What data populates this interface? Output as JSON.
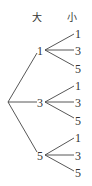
{
  "diagram": {
    "type": "tree",
    "headers": {
      "big": "大",
      "small": "小"
    },
    "root": {
      "x": 8,
      "y": 102
    },
    "branches": [
      {
        "label": "1",
        "x": 41,
        "y": 50,
        "children": [
          {
            "label": "1",
            "y": 33
          },
          {
            "label": "3",
            "y": 50
          },
          {
            "label": "5",
            "y": 68
          }
        ]
      },
      {
        "label": "3",
        "x": 41,
        "y": 102,
        "children": [
          {
            "label": "1",
            "y": 85
          },
          {
            "label": "3",
            "y": 102
          },
          {
            "label": "5",
            "y": 120
          }
        ]
      },
      {
        "label": "5",
        "x": 41,
        "y": 155,
        "children": [
          {
            "label": "1",
            "y": 137
          },
          {
            "label": "3",
            "y": 155
          },
          {
            "label": "5",
            "y": 172
          }
        ]
      }
    ],
    "colors": {
      "stroke": "#444444",
      "text": "#333333",
      "background": "#ffffff"
    }
  }
}
